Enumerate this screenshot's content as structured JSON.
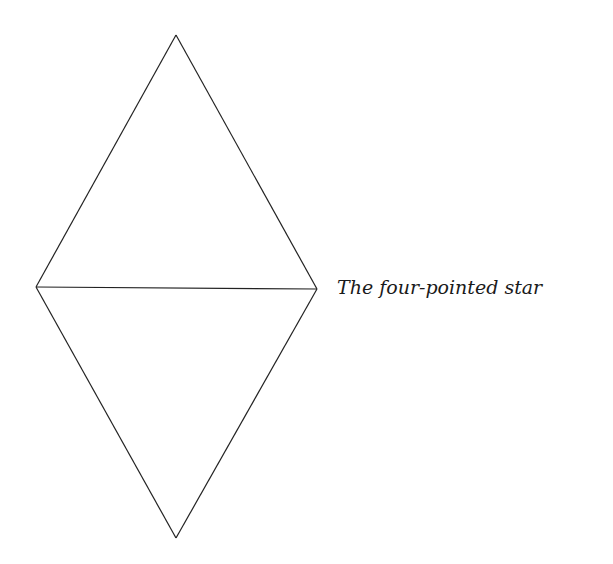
{
  "diagram": {
    "caption": "The four-pointed star",
    "stroke_color": "#222222",
    "shape": {
      "name": "rhombus-of-two-triangles",
      "vertices": {
        "top": [
          176,
          35
        ],
        "left": [
          36,
          287
        ],
        "right": [
          317,
          289
        ],
        "bottom": [
          176,
          538
        ]
      },
      "segments": [
        [
          "top",
          "left"
        ],
        [
          "top",
          "right"
        ],
        [
          "left",
          "right"
        ],
        [
          "left",
          "bottom"
        ],
        [
          "right",
          "bottom"
        ]
      ]
    }
  }
}
